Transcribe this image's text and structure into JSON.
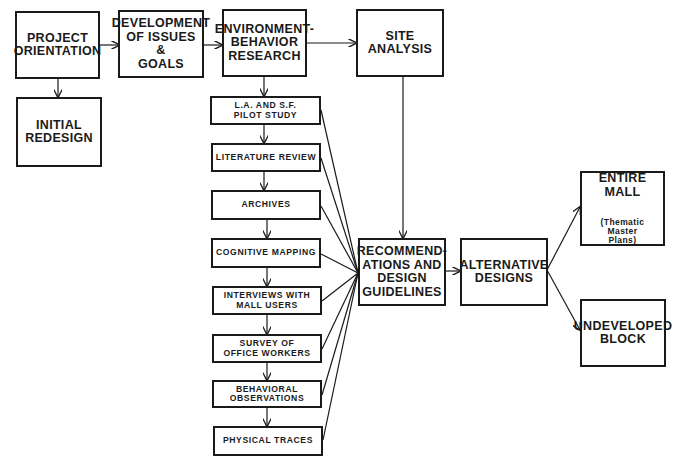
{
  "diagram": {
    "type": "flowchart",
    "main_flow": [
      {
        "id": "project_orientation",
        "label": "PROJECT\nORIENTATION"
      },
      {
        "id": "issues_goals",
        "label": "DEVELOPMENT\nOF ISSUES\n&\nGOALS"
      },
      {
        "id": "eb_research",
        "label": "ENVIRONMENT-\nBEHAVIOR\nRESEARCH"
      },
      {
        "id": "site_analysis",
        "label": "SITE\nANALYSIS"
      }
    ],
    "initial_redesign": {
      "id": "initial_redesign",
      "label": "INITIAL\nREDESIGN"
    },
    "research_steps": [
      {
        "id": "pilot_study",
        "label": "L.A. AND S.F.\nPILOT STUDY"
      },
      {
        "id": "literature_review",
        "label": "LITERATURE REVIEW"
      },
      {
        "id": "archives",
        "label": "ARCHIVES"
      },
      {
        "id": "cognitive_mapping",
        "label": "COGNITIVE MAPPING"
      },
      {
        "id": "interviews",
        "label": "INTERVIEWS WITH\nMALL USERS"
      },
      {
        "id": "survey",
        "label": "SURVEY OF\nOFFICE WORKERS"
      },
      {
        "id": "behavioral_observations",
        "label": "BEHAVIORAL\nOBSERVATIONS"
      },
      {
        "id": "physical_traces",
        "label": "PHYSICAL TRACES"
      }
    ],
    "recommendations": {
      "id": "recommendations",
      "label": "RECOMMEND-\nATIONS AND\nDESIGN\nGUIDELINES"
    },
    "alternative_designs": {
      "id": "alternative_designs",
      "label": "ALTERNATIVE\nDESIGNS"
    },
    "outcomes": [
      {
        "id": "entire_mall",
        "label": "ENTIRE\nMALL",
        "note": "(Thematic\nMaster\nPlans)"
      },
      {
        "id": "undeveloped_block",
        "label": "UNDEVELOPED\nBLOCK"
      }
    ],
    "edges": [
      [
        "project_orientation",
        "issues_goals"
      ],
      [
        "project_orientation",
        "initial_redesign"
      ],
      [
        "issues_goals",
        "eb_research"
      ],
      [
        "eb_research",
        "site_analysis"
      ],
      [
        "eb_research",
        "pilot_study"
      ],
      [
        "pilot_study",
        "literature_review"
      ],
      [
        "literature_review",
        "archives"
      ],
      [
        "archives",
        "cognitive_mapping"
      ],
      [
        "cognitive_mapping",
        "interviews"
      ],
      [
        "interviews",
        "survey"
      ],
      [
        "survey",
        "behavioral_observations"
      ],
      [
        "behavioral_observations",
        "physical_traces"
      ],
      [
        "pilot_study",
        "recommendations"
      ],
      [
        "literature_review",
        "recommendations"
      ],
      [
        "archives",
        "recommendations"
      ],
      [
        "cognitive_mapping",
        "recommendations"
      ],
      [
        "interviews",
        "recommendations"
      ],
      [
        "survey",
        "recommendations"
      ],
      [
        "behavioral_observations",
        "recommendations"
      ],
      [
        "physical_traces",
        "recommendations"
      ],
      [
        "site_analysis",
        "recommendations"
      ],
      [
        "recommendations",
        "alternative_designs"
      ],
      [
        "alternative_designs",
        "entire_mall"
      ],
      [
        "alternative_designs",
        "undeveloped_block"
      ]
    ]
  }
}
